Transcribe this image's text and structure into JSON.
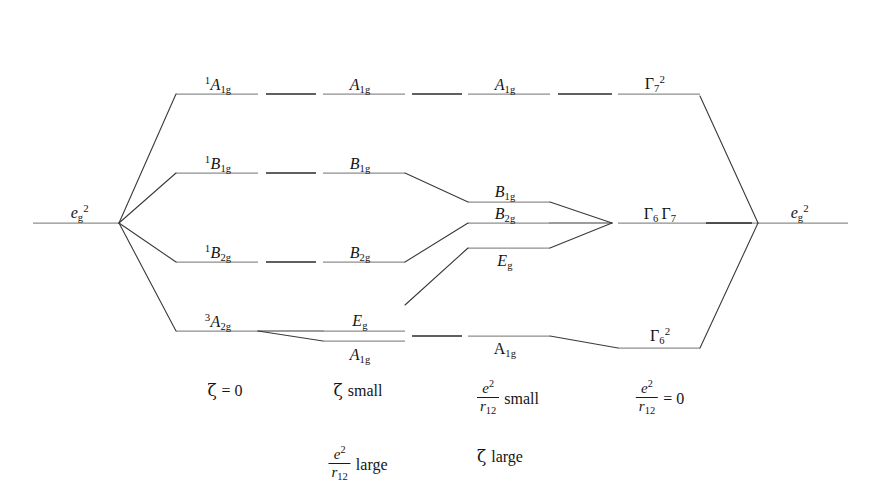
{
  "figure": {
    "type": "energy-level-correlation-diagram",
    "title": "",
    "width": 876,
    "height": 497,
    "background_color": "#ffffff",
    "level_line_color": "#8e8e8e",
    "connector_color": "#2a2a2a",
    "correlation_line_color": "#3a3a3a"
  },
  "column_headers": [
    {
      "label": "(a)",
      "x": 68,
      "y": 40
    },
    {
      "label": "(b)",
      "x": 218,
      "y": 40
    },
    {
      "label": "(c)",
      "x": 345,
      "y": 40
    },
    {
      "label": "(d)",
      "x": 508,
      "y": 40
    },
    {
      "label": "(e)",
      "x": 650,
      "y": 40
    },
    {
      "label": "(f)",
      "x": 800,
      "y": 40
    }
  ],
  "levels": [
    {
      "id": "a-eg2",
      "column": "a",
      "base": "e",
      "sup": "2",
      "sub": "g",
      "upright": false,
      "sup_post": true,
      "x1": 33,
      "x2": 119,
      "y": 223,
      "label_x": 80,
      "label_y": 205
    },
    {
      "id": "b-A1g",
      "column": "b",
      "pre_sup": "1",
      "base": "A",
      "sub": "1g",
      "upright": false,
      "x1": 176,
      "x2": 258,
      "y": 94,
      "label_x": 218,
      "label_y": 77
    },
    {
      "id": "b-B1g",
      "column": "b",
      "pre_sup": "1",
      "base": "B",
      "sub": "1g",
      "upright": false,
      "x1": 176,
      "x2": 258,
      "y": 173,
      "label_x": 218,
      "label_y": 156
    },
    {
      "id": "b-B2g",
      "column": "b",
      "pre_sup": "1",
      "base": "B",
      "sub": "2g",
      "upright": false,
      "x1": 176,
      "x2": 258,
      "y": 262,
      "label_x": 218,
      "label_y": 245
    },
    {
      "id": "b-A2g",
      "column": "b",
      "pre_sup": "3",
      "base": "A",
      "sub": "2g",
      "upright": false,
      "x1": 176,
      "x2": 258,
      "y": 331,
      "label_x": 218,
      "label_y": 314
    },
    {
      "id": "c-A1g",
      "column": "c",
      "base": "A",
      "sub": "1g",
      "upright": false,
      "x1": 323,
      "x2": 405,
      "y": 94,
      "label_x": 360,
      "label_y": 77
    },
    {
      "id": "c-B1g",
      "column": "c",
      "base": "B",
      "sub": "1g",
      "upright": false,
      "x1": 323,
      "x2": 405,
      "y": 173,
      "label_x": 360,
      "label_y": 156
    },
    {
      "id": "c-B2g",
      "column": "c",
      "base": "B",
      "sub": "2g",
      "upright": false,
      "x1": 323,
      "x2": 405,
      "y": 262,
      "label_x": 360,
      "label_y": 245
    },
    {
      "id": "c-Eg",
      "column": "c",
      "base": "E",
      "sub": "g",
      "upright": false,
      "x1": 323,
      "x2": 405,
      "y": 331,
      "label_x": 360,
      "label_y": 313
    },
    {
      "id": "c-A1g-b",
      "column": "c",
      "base": "A",
      "sub": "1g",
      "upright": false,
      "x1": 323,
      "x2": 405,
      "y": 341,
      "label_x": 360,
      "label_y": 347
    },
    {
      "id": "d-A1g",
      "column": "d",
      "base": "A",
      "sub": "1g",
      "upright": false,
      "x1": 468,
      "x2": 550,
      "y": 94,
      "label_x": 505,
      "label_y": 77
    },
    {
      "id": "d-B1g",
      "column": "d",
      "base": "B",
      "sub": "1g",
      "upright": false,
      "x1": 468,
      "x2": 550,
      "y": 202,
      "label_x": 505,
      "label_y": 184
    },
    {
      "id": "d-B2g",
      "column": "d",
      "base": "B",
      "sub": "2g",
      "upright": false,
      "x1": 468,
      "x2": 550,
      "y": 223,
      "label_x": 505,
      "label_y": 206
    },
    {
      "id": "d-Eg",
      "column": "d",
      "base": "E",
      "sub": "g",
      "upright": false,
      "x1": 468,
      "x2": 550,
      "y": 248,
      "label_x": 505,
      "label_y": 253
    },
    {
      "id": "d-A1g-b",
      "column": "d",
      "base": "A",
      "sub": "1g",
      "upright": true,
      "x1": 468,
      "x2": 550,
      "y": 336,
      "label_x": 505,
      "label_y": 341
    },
    {
      "id": "e-G7",
      "column": "e",
      "base": "Γ",
      "sup": "2",
      "sub": "7",
      "upright": true,
      "x1": 618,
      "x2": 700,
      "y": 94,
      "label_x": 655,
      "label_y": 76
    },
    {
      "id": "e-G6G7",
      "column": "e",
      "base": "Γ",
      "sub": "6",
      "base2": "Γ",
      "sub2": "7",
      "upright": true,
      "x1": 618,
      "x2": 758,
      "y": 223,
      "label_x": 660,
      "label_y": 206
    },
    {
      "id": "e-G6sq",
      "column": "e",
      "base": "Γ",
      "sub": "6",
      "sup_post": "2",
      "upright": true,
      "x1": 618,
      "x2": 700,
      "y": 348,
      "label_x": 660,
      "label_y": 328
    },
    {
      "id": "f-eg2",
      "column": "f",
      "base": "e",
      "sup": "2",
      "sub": "g",
      "upright": false,
      "sup_post": true,
      "x1": 758,
      "x2": 848,
      "y": 223,
      "label_x": 800,
      "label_y": 205
    }
  ],
  "level_lines": [
    {
      "name": "a-eg2-line",
      "x1": 33,
      "x2": 119,
      "y": 223,
      "kind": "level"
    },
    {
      "name": "b-A1g-line",
      "x1": 176,
      "x2": 258,
      "y": 94,
      "kind": "level"
    },
    {
      "name": "b-B1g-line",
      "x1": 176,
      "x2": 258,
      "y": 173,
      "kind": "level"
    },
    {
      "name": "b-B2g-line",
      "x1": 176,
      "x2": 258,
      "y": 262,
      "kind": "level"
    },
    {
      "name": "b-A2g-line",
      "x1": 176,
      "x2": 258,
      "y": 331,
      "kind": "level"
    },
    {
      "name": "c-A1g-line",
      "x1": 323,
      "x2": 405,
      "y": 94,
      "kind": "level"
    },
    {
      "name": "c-B1g-line",
      "x1": 323,
      "x2": 405,
      "y": 173,
      "kind": "level"
    },
    {
      "name": "c-B2g-line",
      "x1": 323,
      "x2": 405,
      "y": 262,
      "kind": "level"
    },
    {
      "name": "c-Eg-line",
      "x1": 323,
      "x2": 405,
      "y": 331,
      "kind": "level"
    },
    {
      "name": "c-A1gb-line",
      "x1": 323,
      "x2": 405,
      "y": 341,
      "kind": "level"
    },
    {
      "name": "d-A1g-line",
      "x1": 468,
      "x2": 550,
      "y": 94,
      "kind": "level"
    },
    {
      "name": "d-B1g-line",
      "x1": 468,
      "x2": 550,
      "y": 202,
      "kind": "level"
    },
    {
      "name": "d-B2g-line",
      "x1": 468,
      "x2": 550,
      "y": 223,
      "kind": "level"
    },
    {
      "name": "d-Eg-line",
      "x1": 468,
      "x2": 550,
      "y": 248,
      "kind": "level"
    },
    {
      "name": "d-A1gb-line",
      "x1": 468,
      "x2": 550,
      "y": 336,
      "kind": "level"
    },
    {
      "name": "e-G7-line",
      "x1": 618,
      "x2": 700,
      "y": 94,
      "kind": "level"
    },
    {
      "name": "e-G6G7-line",
      "x1": 618,
      "x2": 758,
      "y": 223,
      "kind": "level"
    },
    {
      "name": "e-G6sq-line",
      "x1": 618,
      "x2": 700,
      "y": 348,
      "kind": "level"
    },
    {
      "name": "f-eg2-line",
      "x1": 758,
      "x2": 848,
      "y": 223,
      "kind": "level"
    }
  ],
  "connectors": [
    {
      "name": "conn-b-c-A1g",
      "x1": 266,
      "y1": 94,
      "x2": 316,
      "y2": 94
    },
    {
      "name": "conn-b-c-B1g",
      "x1": 266,
      "y1": 173,
      "x2": 316,
      "y2": 173
    },
    {
      "name": "conn-b-c-B2g",
      "x1": 266,
      "y1": 262,
      "x2": 316,
      "y2": 262
    },
    {
      "name": "conn-c-d-A1g",
      "x1": 412,
      "y1": 94,
      "x2": 462,
      "y2": 94
    },
    {
      "name": "conn-c-d-Eg",
      "x1": 412,
      "y1": 336,
      "x2": 462,
      "y2": 336
    },
    {
      "name": "conn-d-e-A1g",
      "x1": 558,
      "y1": 94,
      "x2": 612,
      "y2": 94
    },
    {
      "name": "conn-e-f",
      "x1": 706,
      "y1": 223,
      "x2": 752,
      "y2": 223
    }
  ],
  "correlation_lines": [
    {
      "name": "fan-a-to-b-A1g",
      "x1": 119,
      "y1": 223,
      "x2": 176,
      "y2": 94
    },
    {
      "name": "fan-a-to-b-B1g",
      "x1": 119,
      "y1": 223,
      "x2": 176,
      "y2": 173
    },
    {
      "name": "fan-a-to-b-B2g",
      "x1": 119,
      "y1": 223,
      "x2": 176,
      "y2": 262
    },
    {
      "name": "fan-a-to-b-A2g",
      "x1": 119,
      "y1": 223,
      "x2": 176,
      "y2": 331
    },
    {
      "name": "split-b-A2g-to-c-Eg",
      "x1": 258,
      "y1": 331,
      "x2": 323,
      "y2": 331
    },
    {
      "name": "split-b-A2g-to-c-A1g",
      "x1": 258,
      "y1": 331,
      "x2": 323,
      "y2": 341
    },
    {
      "name": "corr-c-B1g-to-d-B1g",
      "x1": 405,
      "y1": 173,
      "x2": 468,
      "y2": 202
    },
    {
      "name": "corr-c-B2g-to-d-B2g",
      "x1": 405,
      "y1": 262,
      "x2": 468,
      "y2": 223
    },
    {
      "name": "corr-c-Eg-to-d-Eg",
      "x1": 405,
      "y1": 305,
      "x2": 468,
      "y2": 248
    },
    {
      "name": "merge-d-B1g-to-e",
      "x1": 550,
      "y1": 202,
      "x2": 612,
      "y2": 223
    },
    {
      "name": "merge-d-B2g-to-e",
      "x1": 550,
      "y1": 223,
      "x2": 612,
      "y2": 223
    },
    {
      "name": "merge-d-Eg-to-e",
      "x1": 550,
      "y1": 248,
      "x2": 612,
      "y2": 223
    },
    {
      "name": "corr-d-A1g-to-e-G6sq",
      "x1": 550,
      "y1": 336,
      "x2": 618,
      "y2": 348
    },
    {
      "name": "corr-e-G7-to-f",
      "x1": 700,
      "y1": 96,
      "x2": 758,
      "y2": 223
    },
    {
      "name": "corr-e-G6sq-to-f",
      "x1": 700,
      "y1": 348,
      "x2": 758,
      "y2": 223
    }
  ],
  "captions": [
    {
      "name": "caption-b",
      "x": 225,
      "y": 382,
      "parts": [
        {
          "kind": "zeta",
          "text": "ζ"
        },
        {
          "kind": "text",
          "text": "= 0"
        }
      ]
    },
    {
      "name": "caption-c-1",
      "x": 360,
      "y": 382,
      "parts": [
        {
          "kind": "zeta",
          "text": "ζ"
        },
        {
          "kind": "text",
          "text": "small"
        }
      ]
    },
    {
      "name": "caption-c-2",
      "x": 360,
      "y": 446,
      "parts": [
        {
          "kind": "frac",
          "num": "e",
          "num_sup": "2",
          "den": "r",
          "den_sub": "12"
        },
        {
          "kind": "text",
          "text": "large"
        }
      ]
    },
    {
      "name": "caption-d-1",
      "x": 508,
      "y": 446,
      "parts": [
        {
          "kind": "frac",
          "num": "e",
          "num_sup": "2",
          "den": "r",
          "den_sub": "12"
        },
        {
          "kind": "text",
          "text": "small"
        }
      ]
    },
    {
      "name": "caption-d-2",
      "x": 508,
      "y": 446,
      "parts": [
        {
          "kind": "zeta",
          "text": "ζ"
        },
        {
          "kind": "text",
          "text": "large"
        }
      ]
    },
    {
      "name": "caption-e",
      "x": 660,
      "y": 382,
      "parts": [
        {
          "kind": "frac",
          "num": "e",
          "num_sup": "2",
          "den": "r",
          "den_sub": "12"
        },
        {
          "kind": "text",
          "text": "= 0"
        }
      ]
    }
  ],
  "caption_layout": [
    {
      "name": "caption-b",
      "x": 225,
      "y": 382
    },
    {
      "name": "caption-c-1",
      "x": 358,
      "y": 382
    },
    {
      "name": "caption-c-2",
      "x": 358,
      "y": 448
    },
    {
      "name": "caption-d-1",
      "x": 508,
      "y": 382
    },
    {
      "name": "caption-d-2",
      "x": 500,
      "y": 448
    },
    {
      "name": "caption-e",
      "x": 660,
      "y": 382
    }
  ]
}
